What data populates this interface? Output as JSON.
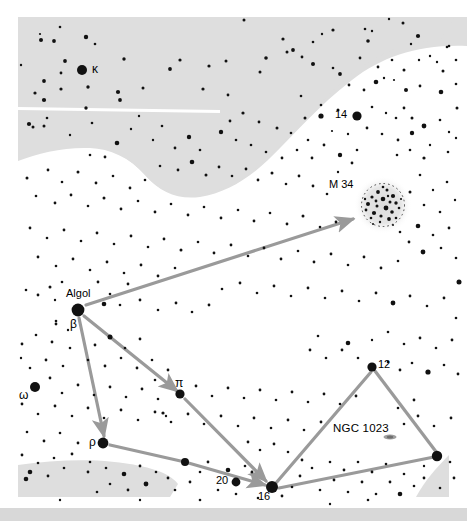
{
  "chart": {
    "type": "star-chart",
    "title_visible": false,
    "width": 467,
    "height": 521,
    "background_color": "#ffffff",
    "milkyway_color": "#dedede",
    "milkyway_color_light": "#e8e8e8",
    "star_color": "#111111",
    "arrow_color": "#9a9a9a",
    "footer_bar_color": "#d8d8d8",
    "cluster_halo_color": "#e2e2e2"
  },
  "labels": {
    "kappa": "κ",
    "algol": "Algol",
    "beta": "β",
    "omega": "ω",
    "rho": "ρ",
    "pi": "π",
    "star_14": "14",
    "star_16": "16",
    "star_20": "20",
    "star_12": "12",
    "m34": "M 34",
    "ngc1023": "NGC 1023"
  },
  "named_objects": [
    {
      "id": "kappa",
      "label": "κ",
      "x": 82,
      "y": 70,
      "r": 5.0,
      "label_x": 92,
      "label_y": 64,
      "kind": "star"
    },
    {
      "id": "14",
      "label": "14",
      "x": 357,
      "y": 116,
      "r": 4.6,
      "label_x": 337,
      "label_y": 110,
      "kind": "star"
    },
    {
      "id": "m34",
      "label": "M 34",
      "x": 383,
      "y": 205,
      "r": 0,
      "label_x": 330,
      "label_y": 180,
      "kind": "open-cluster"
    },
    {
      "id": "algol",
      "label": "Algol",
      "x": 78,
      "y": 310,
      "r": 6.4,
      "label_x": 68,
      "label_y": 290,
      "kind": "star"
    },
    {
      "id": "beta",
      "label": "β",
      "x": 78,
      "y": 310,
      "r": 0,
      "label_x": 71,
      "label_y": 320,
      "kind": "greek-label"
    },
    {
      "id": "omega",
      "label": "ω",
      "x": 35,
      "y": 387,
      "r": 5.0,
      "label_x": 20,
      "label_y": 392,
      "kind": "star"
    },
    {
      "id": "pi",
      "label": "π",
      "x": 180,
      "y": 394,
      "r": 4.6,
      "label_x": 176,
      "label_y": 379,
      "kind": "star"
    },
    {
      "id": "12",
      "label": "12",
      "x": 372,
      "y": 367,
      "r": 4.6,
      "label_x": 378,
      "label_y": 361,
      "kind": "star"
    },
    {
      "id": "ngc1023",
      "label": "NGC 1023",
      "x": 390,
      "y": 436,
      "r": 0,
      "label_x": 336,
      "label_y": 425,
      "kind": "galaxy"
    },
    {
      "id": "rho",
      "label": "ρ",
      "x": 103,
      "y": 443,
      "r": 5.4,
      "label_x": 90,
      "label_y": 437,
      "kind": "star"
    },
    {
      "id": "20",
      "label": "20",
      "x": 236,
      "y": 482,
      "r": 4.4,
      "label_x": 217,
      "label_y": 476,
      "kind": "star"
    },
    {
      "id": "16",
      "label": "16",
      "x": 272,
      "y": 487,
      "r": 6.0,
      "label_x": 259,
      "label_y": 492,
      "kind": "star"
    }
  ],
  "star_hop_paths": [
    {
      "from": "Algol",
      "to": "M 34",
      "arrow": true,
      "points": [
        [
          86,
          305
        ],
        [
          353,
          219
        ]
      ]
    },
    {
      "from": "Algol",
      "to": "π",
      "arrow": true,
      "points": [
        [
          84,
          316
        ],
        [
          176,
          390
        ]
      ]
    },
    {
      "from": "π",
      "to": "16",
      "arrow": true,
      "points": [
        [
          184,
          398
        ],
        [
          266,
          481
        ]
      ]
    },
    {
      "from": "Algol",
      "to": "ρ",
      "arrow": true,
      "points": [
        [
          79,
          318
        ],
        [
          104,
          436
        ]
      ]
    },
    {
      "from": "ρ",
      "to": "16",
      "arrow": true,
      "points": [
        [
          110,
          445
        ],
        [
          185,
          462
        ],
        [
          265,
          485
        ]
      ]
    },
    {
      "from": "16",
      "to": "12",
      "arrow": false,
      "points": [
        [
          276,
          483
        ],
        [
          371,
          372
        ]
      ]
    },
    {
      "from": "12",
      "to": "NGC 1023 star",
      "arrow": false,
      "points": [
        [
          375,
          371
        ],
        [
          437,
          453
        ]
      ]
    },
    {
      "from": "NGC 1023 star",
      "to": "16",
      "arrow": false,
      "points": [
        [
          434,
          457
        ],
        [
          279,
          488
        ]
      ]
    }
  ],
  "milkyway_regions": [
    {
      "name": "upper-band",
      "description": "large light-grey Milky Way band across top-left with scalloped lower boundary"
    },
    {
      "name": "lower-left-wedge",
      "description": "curved grey wedge at bottom-left"
    },
    {
      "name": "lower-right-wedge",
      "description": "grey triangular wedge at bottom-right corner"
    }
  ],
  "footer": {
    "visible": true,
    "height": 13
  },
  "star_field": {
    "description": "dense scattered field of black dots of varying magnitude",
    "count_approx": 330
  }
}
